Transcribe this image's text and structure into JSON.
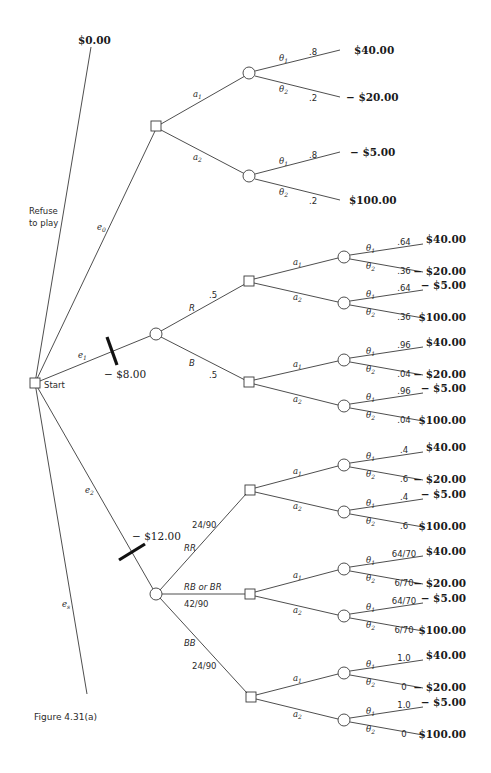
{
  "figure": {
    "caption": "Figure 4.31(a)",
    "start_label": "Start",
    "refuse_label_line1": "Refuse",
    "refuse_label_line2": "to play",
    "refuse_payoff": "$0.00"
  },
  "experiments": [
    {
      "id": "e0",
      "symbol": "e",
      "sub": "0",
      "cost": ""
    },
    {
      "id": "e1",
      "symbol": "e",
      "sub": "1",
      "cost": "− $8.00"
    },
    {
      "id": "e2",
      "symbol": "e",
      "sub": "2",
      "cost": "− $12.00"
    },
    {
      "id": "es",
      "symbol": "e",
      "sub": "s",
      "cost": ""
    }
  ],
  "actions": {
    "a1": "a",
    "a1_sub": "1",
    "a2": "a",
    "a2_sub": "2"
  },
  "states": {
    "t1": "θ",
    "t1_sub": "1",
    "t2": "θ",
    "t2_sub": "2"
  },
  "payoffs": {
    "a1_t1": "$40.00",
    "a1_t2": "− $20.00",
    "a2_t1": "− $5.00",
    "a2_t2": "$100.00"
  },
  "branches": {
    "e0": {
      "outcome_label": "",
      "outcome_prob": "",
      "p_theta1": ".8",
      "p_theta2": ".2"
    },
    "e1_R": {
      "outcome_label": "R",
      "outcome_prob": ".5",
      "p_theta1": ".64",
      "p_theta2": ".36"
    },
    "e1_B": {
      "outcome_label": "B",
      "outcome_prob": ".5",
      "p_theta1": ".96",
      "p_theta2": ".04"
    },
    "e2_RR": {
      "outcome_label": "RR",
      "outcome_prob": "24/90",
      "p_theta1": ".4",
      "p_theta2": ".6"
    },
    "e2_RB": {
      "outcome_label": "RB or BR",
      "outcome_prob": "42/90",
      "p_theta1": "64/70",
      "p_theta2": "6/70"
    },
    "e2_BB": {
      "outcome_label": "BB",
      "outcome_prob": "24/90",
      "p_theta1": "1.0",
      "p_theta2": "0"
    }
  }
}
